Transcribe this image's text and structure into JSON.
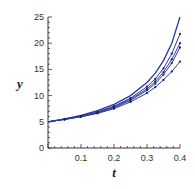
{
  "chart_data": {
    "type": "line",
    "title": "",
    "xlabel": "t",
    "ylabel": "y",
    "xlim": [
      0,
      0.4
    ],
    "ylim": [
      0,
      25
    ],
    "xticks": [
      0.1,
      0.2,
      0.3,
      0.4
    ],
    "xtick_labels": [
      "0.1",
      "0.2",
      "0.3",
      "0.4"
    ],
    "yticks": [
      0,
      5,
      10,
      15,
      20,
      25
    ],
    "ytick_labels": [
      "0",
      "5",
      "10",
      "15",
      "20",
      "25"
    ],
    "grid": false,
    "legend": "none",
    "line_color": "#2a3aa0",
    "series": [
      {
        "name": "exact solution",
        "markers": false,
        "x": [
          0,
          0.05,
          0.1,
          0.15,
          0.2,
          0.25,
          0.3,
          0.325,
          0.35,
          0.375,
          0.4
        ],
        "y": [
          5,
          5.56,
          6.25,
          7.14,
          8.33,
          10,
          12.5,
          14.29,
          16.67,
          20,
          25
        ]
      },
      {
        "name": "approximation 1",
        "markers": true,
        "x": [
          0,
          0.05,
          0.1,
          0.15,
          0.2,
          0.25,
          0.3,
          0.325,
          0.35,
          0.375,
          0.4
        ],
        "y": [
          5,
          5.5,
          6.1,
          6.9,
          8.0,
          9.5,
          11.7,
          13.2,
          15.2,
          18.0,
          21.8
        ]
      },
      {
        "name": "approximation 2",
        "markers": true,
        "x": [
          0,
          0.05,
          0.1,
          0.15,
          0.2,
          0.25,
          0.3,
          0.325,
          0.35,
          0.375,
          0.4
        ],
        "y": [
          5,
          5.48,
          6.05,
          6.8,
          7.85,
          9.3,
          11.3,
          12.7,
          14.5,
          16.9,
          20.0
        ]
      },
      {
        "name": "approximation 3",
        "markers": true,
        "x": [
          0,
          0.05,
          0.1,
          0.15,
          0.2,
          0.25,
          0.3,
          0.325,
          0.35,
          0.375,
          0.4
        ],
        "y": [
          5,
          5.46,
          6.0,
          6.72,
          7.7,
          9.1,
          11.0,
          12.3,
          14.0,
          16.2,
          19.2
        ]
      },
      {
        "name": "approximation 4",
        "markers": true,
        "x": [
          0,
          0.05,
          0.1,
          0.15,
          0.2,
          0.25,
          0.3,
          0.325,
          0.35,
          0.375,
          0.4
        ],
        "y": [
          5,
          5.44,
          5.95,
          6.6,
          7.5,
          8.8,
          10.5,
          11.6,
          13.0,
          14.6,
          16.5
        ]
      }
    ]
  }
}
